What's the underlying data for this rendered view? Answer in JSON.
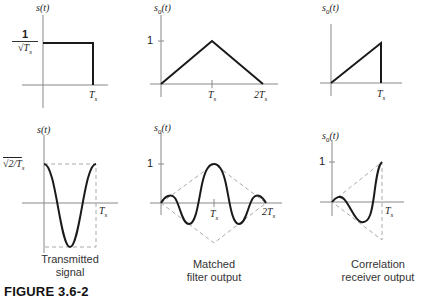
{
  "figure": {
    "title": "FIGURE 3.6-2",
    "colors": {
      "signal": "#1a1a1a",
      "axis": "#777777",
      "dashed": "#aaaaaa"
    }
  },
  "panels": {
    "top_left": {
      "ylabel": "s(t)",
      "y_tick_num": "1",
      "y_tick_den": "√T",
      "y_tick_den_sub": "s",
      "x_tick": "T",
      "x_tick_sub": "s"
    },
    "top_mid": {
      "ylabel": "s",
      "ylabel_sub": "0",
      "ylabel_arg": "(t)",
      "y_tick": "1",
      "x_tick1": "T",
      "x_tick1_sub": "s",
      "x_tick2": "2T",
      "x_tick2_sub": "s"
    },
    "top_right": {
      "ylabel": "s",
      "ylabel_sub": "0",
      "ylabel_arg": "(t)",
      "x_tick": "T",
      "x_tick_sub": "s"
    },
    "bottom_left": {
      "ylabel": "s(t)",
      "y_tick": "√2/T",
      "y_tick_sub": "s",
      "x_tick": "T",
      "x_tick_sub": "s",
      "caption_line1": "Transmitted",
      "caption_line2": "signal"
    },
    "bottom_mid": {
      "ylabel": "s",
      "ylabel_sub": "0",
      "ylabel_arg": "(t)",
      "y_tick": "1",
      "x_tick1": "T",
      "x_tick1_sub": "s",
      "x_tick2": "2T",
      "x_tick2_sub": "s",
      "caption_line1": "Matched",
      "caption_line2": "filter output"
    },
    "bottom_right": {
      "ylabel": "s",
      "ylabel_sub": "0",
      "ylabel_arg": "(t)",
      "y_tick": "1",
      "x_tick": "T",
      "x_tick_sub": "s",
      "caption_line1": "Correlation",
      "caption_line2": "receiver output"
    }
  }
}
